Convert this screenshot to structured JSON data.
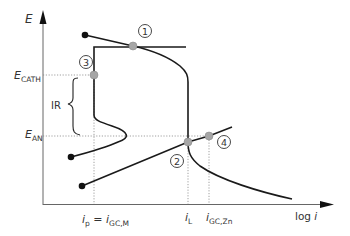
{
  "diagram": {
    "type": "polarization-diagram",
    "axes": {
      "y_label": "E",
      "x_label_prefix": "log ",
      "x_label_var": "i"
    },
    "potential_labels": {
      "cathode": {
        "main": "E",
        "sub": "CATH"
      },
      "anode": {
        "main": "E",
        "sub": "AN"
      },
      "ir_drop": "IR"
    },
    "current_labels": {
      "ip": {
        "main": "i",
        "sub": "p",
        "eq": " = ",
        "main2": "i",
        "sub2": "GC,M"
      },
      "iL": {
        "main": "i",
        "sub": "L"
      },
      "igczn": {
        "main": "i",
        "sub": "GC,Zn"
      }
    },
    "markers": [
      {
        "id": "1",
        "label": "1"
      },
      {
        "id": "2",
        "label": "2"
      },
      {
        "id": "3",
        "label": "3"
      },
      {
        "id": "4",
        "label": "4"
      }
    ],
    "colors": {
      "line": "#1a1a1a",
      "point_fill": "#a6a6a6",
      "point_stroke": "#8a8a8a",
      "dotted": "#777777",
      "axis": "#555555"
    }
  }
}
